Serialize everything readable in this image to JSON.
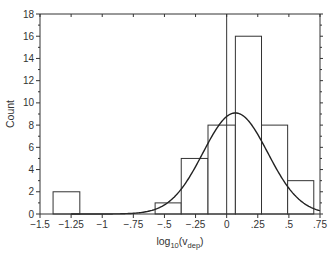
{
  "chart_data": {
    "type": "bar",
    "subtype": "histogram_with_normal_fit",
    "title": "",
    "xlabel": "log10(vdep)",
    "xlabel_parts": {
      "base": "log",
      "sub1": "10",
      "open": "(v",
      "sub2": "dep",
      "close": ")"
    },
    "ylabel": "Count",
    "xlim": [
      -1.5,
      0.75
    ],
    "ylim": [
      0,
      18
    ],
    "x_ticks": [
      -1.5,
      -1.25,
      -1,
      -0.75,
      -0.5,
      -0.25,
      0,
      0.25,
      0.5,
      0.75
    ],
    "x_tick_labels": [
      "−1.5",
      "−1.25",
      "−1",
      "−.75",
      "−.5",
      "−.25",
      "0",
      ".25",
      ".5",
      ".75"
    ],
    "y_ticks": [
      0,
      2,
      4,
      6,
      8,
      10,
      12,
      14,
      16,
      18
    ],
    "y_tick_labels": [
      "0",
      "2",
      "4",
      "6",
      "8",
      "10",
      "12",
      "14",
      "16",
      "18"
    ],
    "grid": false,
    "legend": null,
    "bins": [
      {
        "x0": -1.395,
        "x1": -1.18,
        "count": 2
      },
      {
        "x0": -0.575,
        "x1": -0.365,
        "count": 1
      },
      {
        "x0": -0.365,
        "x1": -0.15,
        "count": 5
      },
      {
        "x0": -0.15,
        "x1": 0.07,
        "count": 8
      },
      {
        "x0": 0.07,
        "x1": 0.28,
        "count": 16
      },
      {
        "x0": 0.28,
        "x1": 0.49,
        "count": 8
      },
      {
        "x0": 0.49,
        "x1": 0.7,
        "count": 3
      }
    ],
    "categories": [
      "-1.29",
      "-0.47",
      "-0.26",
      "-0.04",
      "0.18",
      "0.39",
      "0.60"
    ],
    "values": [
      2,
      1,
      5,
      8,
      16,
      8,
      3
    ],
    "normal_fit": {
      "mean": 0.07,
      "sd": 0.26,
      "peak": 9.1
    },
    "reference_line_x": 0
  }
}
